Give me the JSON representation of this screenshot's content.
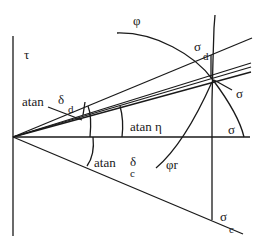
{
  "diagram": {
    "type": "Mohr-Coulomb stress diagram",
    "axes": {
      "vertical": "τ",
      "horizontal": "σ"
    },
    "labels": {
      "tau": "τ",
      "sigma_axis": "σ",
      "atan_delta_d": "atan",
      "delta_d_symbol": "δ",
      "delta_d_sub": "d",
      "atan_eta": "atan  η",
      "atan_delta_c": "atan",
      "delta_c_symbol": "δ",
      "delta_c_sub": "c",
      "phi": "φ",
      "phi_r": "φr",
      "sigma_d": "σ",
      "sigma_d_sub": "d",
      "sigma_point": "σ",
      "sigma_c": "σ",
      "sigma_c_sub": "c"
    },
    "colors": {
      "line": "#1a1a1a",
      "background": "#ffffff"
    }
  }
}
